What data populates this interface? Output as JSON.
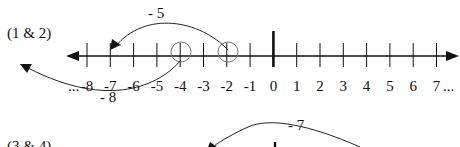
{
  "problems": [
    {
      "label": "(1 & 2)",
      "number_line": {
        "min_label": "...-8",
        "ticks": [
          "-8",
          "-7",
          "-6",
          "-5",
          "-4",
          "-3",
          "-2",
          "-1",
          "0",
          "1",
          "2",
          "3",
          "4",
          "5",
          "6",
          "7"
        ],
        "end_label": "7...",
        "left_ellipsis": "...",
        "right_ellipsis": "..."
      },
      "circled_points": [
        "-4",
        "-2"
      ],
      "jumps": [
        {
          "label": "- 5",
          "from": "-2",
          "to": "-7",
          "side": "above"
        },
        {
          "label": "- 8",
          "from": "-4",
          "to": "-12",
          "side": "below"
        }
      ]
    },
    {
      "label": "(3 & 4)",
      "jumps": [
        {
          "label": "- 7",
          "side": "above"
        }
      ]
    }
  ],
  "colors": {
    "line": "#111111",
    "circle": "#666666",
    "background": "#ffffff"
  }
}
